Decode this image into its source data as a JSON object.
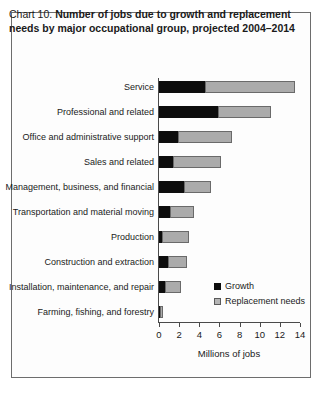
{
  "frame": {
    "border_color": "#6d6d6d"
  },
  "title": {
    "label_prefix": "Chart 10.",
    "text": "Number of jobs due to growth and replacement needs by major occupational group, projected 2004–2014"
  },
  "legend": {
    "items": [
      {
        "name": "growth",
        "label": "Growth",
        "color": "#0d0d0d"
      },
      {
        "name": "replacement",
        "label": "Replacement needs",
        "color": "#b5b5b5"
      }
    ]
  },
  "axis": {
    "x_title": "Millions of jobs",
    "ticks": [
      "0",
      "2",
      "4",
      "6",
      "8",
      "10",
      "12",
      "14"
    ]
  },
  "chart_data": {
    "type": "bar",
    "orientation": "horizontal",
    "stacked": true,
    "title": "Chart 10. Number of jobs due to growth and replacement needs by major occupational group, projected 2004–2014",
    "xlabel": "Millions of jobs",
    "ylabel": "",
    "xlim": [
      0,
      14
    ],
    "xticks": [
      0,
      2,
      4,
      6,
      8,
      10,
      12,
      14
    ],
    "grid": false,
    "legend_position": "inside-right-lower",
    "categories": [
      "Service",
      "Professional and related",
      "Office and administrative support",
      "Sales and related",
      "Management, business, and financial",
      "Transportation and material moving",
      "Production",
      "Construction and extraction",
      "Installation, maintenance, and repair",
      "Farming, fishing, and forestry"
    ],
    "series": [
      {
        "name": "Growth",
        "color": "#0d0d0d",
        "values": [
          4.6,
          5.9,
          1.9,
          1.4,
          2.5,
          1.1,
          0.3,
          0.9,
          0.6,
          0.05
        ]
      },
      {
        "name": "Replacement needs",
        "color": "#ababab",
        "values": [
          8.9,
          5.2,
          5.3,
          4.8,
          2.7,
          2.4,
          2.7,
          1.9,
          1.6,
          0.25
        ]
      }
    ],
    "totals": [
      13.5,
      11.1,
      7.2,
      6.2,
      5.2,
      3.5,
      3.0,
      2.8,
      2.2,
      0.3
    ]
  },
  "rows": [
    {
      "label": "Service",
      "growth": 4.6,
      "replacement": 8.9
    },
    {
      "label": "Professional and related",
      "growth": 5.9,
      "replacement": 5.2
    },
    {
      "label": "Office and administrative support",
      "growth": 1.9,
      "replacement": 5.3
    },
    {
      "label": "Sales and related",
      "growth": 1.4,
      "replacement": 4.8
    },
    {
      "label": "Management, business, and financial",
      "growth": 2.5,
      "replacement": 2.7
    },
    {
      "label": "Transportation and material moving",
      "growth": 1.1,
      "replacement": 2.4
    },
    {
      "label": "Production",
      "growth": 0.3,
      "replacement": 2.7
    },
    {
      "label": "Construction and extraction",
      "growth": 0.9,
      "replacement": 1.9
    },
    {
      "label": "Installation, maintenance, and repair",
      "growth": 0.6,
      "replacement": 1.6
    },
    {
      "label": "Farming, fishing, and forestry",
      "growth": 0.05,
      "replacement": 0.25
    }
  ]
}
